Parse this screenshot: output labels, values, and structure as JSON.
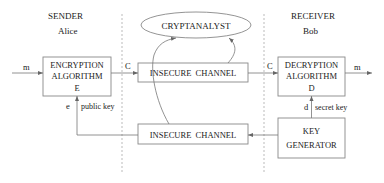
{
  "diagram": {
    "sender": {
      "heading": "SENDER",
      "name": "Alice"
    },
    "receiver": {
      "heading": "RECEIVER",
      "name": "Bob"
    },
    "cryptanalyst": {
      "label": "CRYPTANALYST"
    },
    "encryption_box": {
      "line1": "ENCRYPTION",
      "line2": "ALGORITHM",
      "line3": "E"
    },
    "decryption_box": {
      "line1": "DECRYPTION",
      "line2": "ALGORITHM",
      "line3": "D"
    },
    "key_generator_box": {
      "line1": "KEY",
      "line2": "GENERATOR"
    },
    "channel_top": {
      "label": "INSECURE  CHANNEL"
    },
    "channel_bottom": {
      "label": "INSECURE  CHANNEL"
    },
    "edges": {
      "plaintext_in": "m",
      "ciphertext_out": "C",
      "ciphertext_in": "C",
      "plaintext_out": "m",
      "public_key_symbol": "e",
      "public_key_label": "public key",
      "secret_key_symbol": "d",
      "secret_key_label": "secret key"
    },
    "colors": {
      "stroke": "#888888",
      "text": "#222222",
      "dashed": "#aaaaaa"
    }
  }
}
